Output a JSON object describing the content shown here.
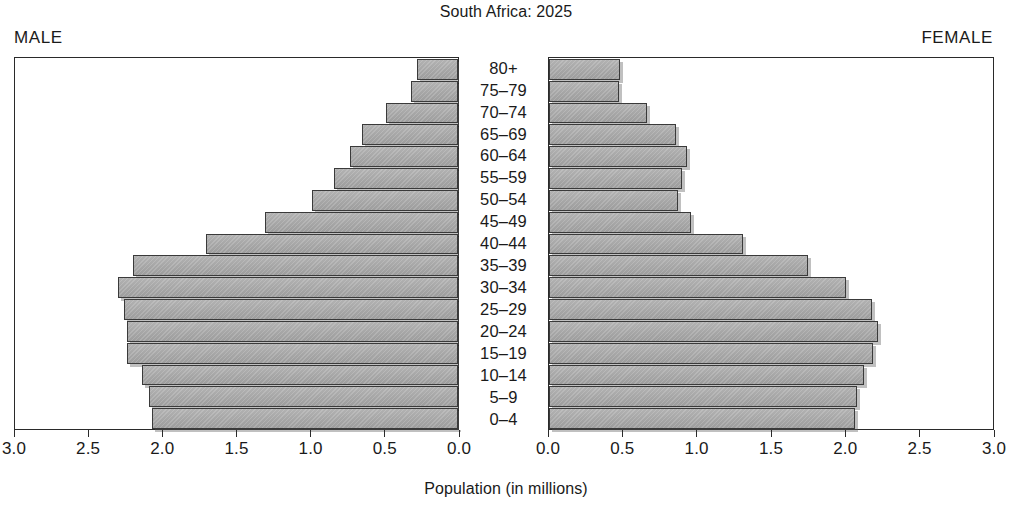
{
  "chart_data": {
    "type": "bar",
    "subtype": "population-pyramid",
    "title": "South Africa: 2025",
    "xlabel": "Population (in millions)",
    "ylabel": "",
    "categories": [
      "80+",
      "75–79",
      "70–74",
      "65–69",
      "60–64",
      "55–59",
      "50–54",
      "45–49",
      "40–44",
      "35–39",
      "30–34",
      "25–29",
      "20–24",
      "15–19",
      "10–14",
      "5–9",
      "0–4"
    ],
    "series": [
      {
        "name": "MALE",
        "side": "left",
        "values": [
          0.28,
          0.32,
          0.49,
          0.65,
          0.73,
          0.84,
          0.99,
          1.31,
          1.71,
          2.2,
          2.3,
          2.26,
          2.24,
          2.24,
          2.14,
          2.09,
          2.07
        ]
      },
      {
        "name": "FEMALE",
        "side": "right",
        "values": [
          0.48,
          0.47,
          0.66,
          0.86,
          0.93,
          0.9,
          0.87,
          0.96,
          1.31,
          1.75,
          2.01,
          2.18,
          2.22,
          2.19,
          2.13,
          2.08,
          2.07
        ]
      }
    ],
    "xlim": [
      0,
      3.0
    ],
    "xticks": [
      0.0,
      0.5,
      1.0,
      1.5,
      2.0,
      2.5,
      3.0
    ],
    "xticklabels_left": [
      "3.0",
      "2.5",
      "2.0",
      "1.5",
      "1.0",
      "0.5",
      "0.0"
    ],
    "xticklabels_right": [
      "0.0",
      "0.5",
      "1.0",
      "1.5",
      "2.0",
      "2.5",
      "3.0"
    ],
    "grid": false,
    "legend": "none",
    "bar_fill_color": "#a6a6a6",
    "bar_edge_color": "#3a3a3a",
    "background_color": "#ffffff"
  },
  "header": {
    "title": "South Africa: 2025"
  },
  "labels": {
    "male": "MALE",
    "female": "FEMALE",
    "axis_title": "Population (in millions)"
  }
}
